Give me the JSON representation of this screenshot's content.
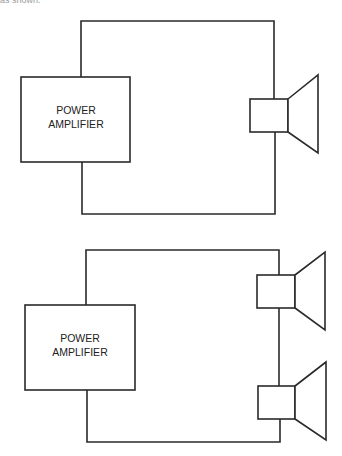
{
  "header_fragment": "as shown.",
  "diagrams": [
    {
      "name": "single-speaker",
      "amplifier": {
        "line1": "POWER",
        "line2": "AMPLIFIER"
      },
      "speakers": 1
    },
    {
      "name": "dual-speaker",
      "amplifier": {
        "line1": "POWER",
        "line2": "AMPLIFIER"
      },
      "speakers": 2
    }
  ],
  "colors": {
    "line": "#2a2a2a",
    "text": "#222222",
    "background": "#ffffff"
  }
}
